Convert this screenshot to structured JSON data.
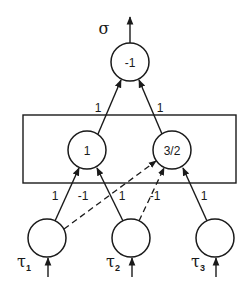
{
  "diagram": {
    "type": "neural-network",
    "output": {
      "label": "σ"
    },
    "nodes": {
      "output": {
        "threshold": "-1",
        "cx": 130,
        "cy": 62
      },
      "hidden": [
        {
          "id": "h1",
          "threshold": "1",
          "cx": 87,
          "cy": 150
        },
        {
          "id": "h2",
          "threshold": "3/2",
          "cx": 172,
          "cy": 150
        }
      ],
      "inputs": [
        {
          "id": "tau1",
          "symbol": "τ",
          "subscript": "1",
          "cx": 47,
          "cy": 238
        },
        {
          "id": "tau2",
          "symbol": "τ",
          "subscript": "2",
          "cx": 131,
          "cy": 238
        },
        {
          "id": "tau3",
          "symbol": "τ",
          "subscript": "3",
          "cx": 215,
          "cy": 238
        }
      ]
    },
    "edges": [
      {
        "from": "h1",
        "to": "output",
        "weight": "1",
        "style": "solid"
      },
      {
        "from": "h2",
        "to": "output",
        "weight": "1",
        "style": "solid"
      },
      {
        "from": "tau1",
        "to": "h1",
        "weight": "1",
        "style": "solid"
      },
      {
        "from": "tau1",
        "to": "h2",
        "weight": "-1",
        "style": "dashed"
      },
      {
        "from": "tau2",
        "to": "h1",
        "weight": "1",
        "style": "solid"
      },
      {
        "from": "tau2",
        "to": "h2",
        "weight": "-1",
        "style": "dashed"
      },
      {
        "from": "tau3",
        "to": "h2",
        "weight": "1",
        "style": "solid"
      }
    ],
    "weight_labels": {
      "h1_out": "1",
      "h2_out": "1",
      "tau1_h1": "1",
      "tau1_h2": "-1",
      "tau2_h1": "1",
      "tau2_h2": "-1",
      "tau3_h2": "1"
    },
    "colors": {
      "stroke": "#1a1a1a",
      "background": "#ffffff"
    }
  }
}
